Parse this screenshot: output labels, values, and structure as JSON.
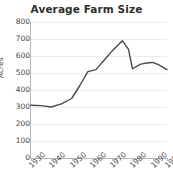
{
  "chart_data": {
    "type": "line",
    "title": "Average Farm Size",
    "xlabel": "",
    "ylabel": "Acres",
    "xlim": [
      1930,
      1997
    ],
    "ylim": [
      0,
      800
    ],
    "grid": true,
    "legend": false,
    "y_ticks": [
      800,
      700,
      600,
      500,
      400,
      300,
      200,
      100,
      0
    ],
    "x_ticks": [
      "1930",
      "1940",
      "1950",
      "1960",
      "1970",
      "1980",
      "1990",
      "1997"
    ],
    "x": [
      1930,
      1935,
      1940,
      1945,
      1950,
      1954,
      1958,
      1962,
      1966,
      1970,
      1975,
      1978,
      1980,
      1984,
      1988,
      1990,
      1993,
      1997
    ],
    "values": [
      310,
      308,
      300,
      318,
      350,
      425,
      508,
      520,
      575,
      630,
      690,
      640,
      525,
      552,
      560,
      562,
      548,
      520
    ],
    "series": [
      {
        "name": "Average Farm Size",
        "color": "#4a4a4a",
        "values": [
          310,
          308,
          300,
          318,
          350,
          425,
          508,
          520,
          575,
          630,
          690,
          640,
          525,
          552,
          560,
          562,
          548,
          520
        ]
      }
    ]
  },
  "style": {
    "line_color": "#4a4a4a",
    "grid_color": "#ececec",
    "axis_color": "#b8b8b8",
    "title_color": "#2e2e2e",
    "tick_color": "#4a4a4a",
    "background": "#ffffff"
  }
}
